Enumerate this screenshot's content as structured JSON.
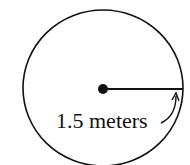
{
  "diagram": {
    "shape": "circle",
    "radius_label": "1.5 meters",
    "colors": {
      "stroke": "#111111",
      "background": "#ffffff"
    }
  }
}
